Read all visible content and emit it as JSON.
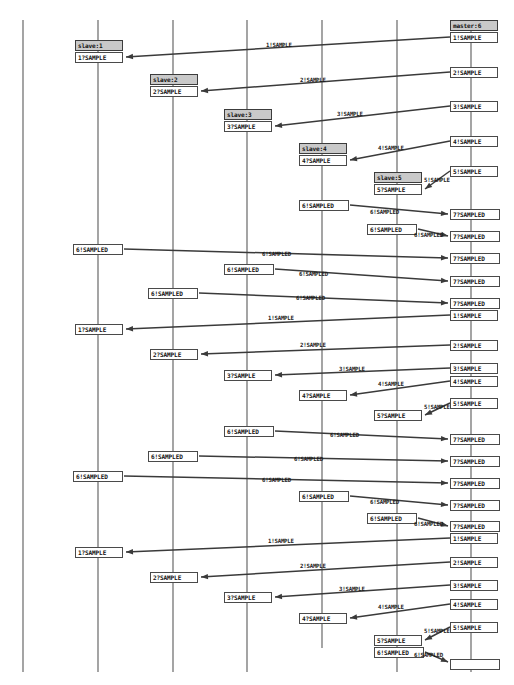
{
  "diagram": {
    "type": "uml-sequence-diagram",
    "title": "",
    "width": 514,
    "height": 685,
    "background_color": "#ffffff",
    "line_color": "#3a3a3a",
    "lifeline_color": "#5a5a5a",
    "head_fill_color": "#c9c9c9",
    "box_fill_color": "#ffffff",
    "lifelines": [
      {
        "name": "lifeline-0",
        "x": 23,
        "y1": 20,
        "y2": 672,
        "label": ""
      },
      {
        "name": "lifeline-1",
        "x": 98,
        "y1": 20,
        "y2": 672,
        "label": ""
      },
      {
        "name": "lifeline-2",
        "x": 173,
        "y1": 20,
        "y2": 672,
        "label": ""
      },
      {
        "name": "lifeline-3",
        "x": 247,
        "y1": 20,
        "y2": 672,
        "label": ""
      },
      {
        "name": "lifeline-4",
        "x": 322,
        "y1": 20,
        "y2": 648,
        "label": ""
      },
      {
        "name": "lifeline-5",
        "x": 397,
        "y1": 20,
        "y2": 672,
        "label": ""
      },
      {
        "name": "lifeline-6",
        "x": 471,
        "y1": 20,
        "y2": 672,
        "label": ""
      }
    ],
    "participants": [
      {
        "id": "master",
        "label": "master:6",
        "x": 450,
        "y": 20,
        "w": 48
      },
      {
        "id": "slave1",
        "label": "slave:1",
        "x": 75,
        "y": 40,
        "w": 48
      },
      {
        "id": "slave2",
        "label": "slave:2",
        "x": 150,
        "y": 74,
        "w": 48
      },
      {
        "id": "slave3",
        "label": "slave:3",
        "x": 224,
        "y": 109,
        "w": 48
      },
      {
        "id": "slave4",
        "label": "slave:4",
        "x": 299,
        "y": 143,
        "w": 48
      },
      {
        "id": "slave5",
        "label": "slave:5",
        "x": 374,
        "y": 172,
        "w": 48
      }
    ],
    "event_boxes": [
      {
        "text": "1!SAMPLE",
        "x": 450,
        "y": 32,
        "w": 48
      },
      {
        "text": "1?SAMPLE",
        "x": 75,
        "y": 52,
        "w": 48
      },
      {
        "text": "2!SAMPLE",
        "x": 450,
        "y": 67,
        "w": 48
      },
      {
        "text": "2?SAMPLE",
        "x": 150,
        "y": 86,
        "w": 48
      },
      {
        "text": "3!SAMPLE",
        "x": 450,
        "y": 101,
        "w": 48
      },
      {
        "text": "3?SAMPLE",
        "x": 224,
        "y": 121,
        "w": 48
      },
      {
        "text": "4!SAMPLE",
        "x": 450,
        "y": 136,
        "w": 48
      },
      {
        "text": "4?SAMPLE",
        "x": 299,
        "y": 155,
        "w": 48
      },
      {
        "text": "5!SAMPLE",
        "x": 450,
        "y": 166,
        "w": 48
      },
      {
        "text": "5?SAMPLE",
        "x": 374,
        "y": 184,
        "w": 48
      },
      {
        "text": "6!SAMPLED",
        "x": 299,
        "y": 200,
        "w": 50
      },
      {
        "text": "7?SAMPLED",
        "x": 450,
        "y": 209,
        "w": 50
      },
      {
        "text": "6!SAMPLED",
        "x": 367,
        "y": 224,
        "w": 50
      },
      {
        "text": "7?SAMPLED",
        "x": 450,
        "y": 231,
        "w": 50
      },
      {
        "text": "6!SAMPLED",
        "x": 73,
        "y": 244,
        "w": 50
      },
      {
        "text": "7?SAMPLED",
        "x": 450,
        "y": 253,
        "w": 50
      },
      {
        "text": "6!SAMPLED",
        "x": 224,
        "y": 264,
        "w": 50
      },
      {
        "text": "7?SAMPLED",
        "x": 450,
        "y": 276,
        "w": 50
      },
      {
        "text": "6!SAMPLED",
        "x": 148,
        "y": 288,
        "w": 50
      },
      {
        "text": "7?SAMPLED",
        "x": 450,
        "y": 298,
        "w": 50
      },
      {
        "text": "1!SAMPLE",
        "x": 450,
        "y": 310,
        "w": 48
      },
      {
        "text": "1?SAMPLE",
        "x": 75,
        "y": 324,
        "w": 48
      },
      {
        "text": "2!SAMPLE",
        "x": 450,
        "y": 340,
        "w": 48
      },
      {
        "text": "2?SAMPLE",
        "x": 150,
        "y": 349,
        "w": 48
      },
      {
        "text": "3!SAMPLE",
        "x": 450,
        "y": 363,
        "w": 48
      },
      {
        "text": "3?SAMPLE",
        "x": 224,
        "y": 370,
        "w": 48
      },
      {
        "text": "4!SAMPLE",
        "x": 450,
        "y": 376,
        "w": 48
      },
      {
        "text": "4?SAMPLE",
        "x": 299,
        "y": 390,
        "w": 48
      },
      {
        "text": "5!SAMPLE",
        "x": 450,
        "y": 398,
        "w": 48
      },
      {
        "text": "5?SAMPLE",
        "x": 374,
        "y": 410,
        "w": 48
      },
      {
        "text": "6!SAMPLED",
        "x": 224,
        "y": 426,
        "w": 50
      },
      {
        "text": "7?SAMPLED",
        "x": 450,
        "y": 434,
        "w": 50
      },
      {
        "text": "6!SAMPLED",
        "x": 148,
        "y": 451,
        "w": 50
      },
      {
        "text": "7?SAMPLED",
        "x": 450,
        "y": 456,
        "w": 50
      },
      {
        "text": "6!SAMPLED",
        "x": 73,
        "y": 471,
        "w": 50
      },
      {
        "text": "7?SAMPLED",
        "x": 450,
        "y": 478,
        "w": 50
      },
      {
        "text": "6!SAMPLED",
        "x": 299,
        "y": 491,
        "w": 50
      },
      {
        "text": "7?SAMPLED",
        "x": 450,
        "y": 500,
        "w": 50
      },
      {
        "text": "6!SAMPLED",
        "x": 367,
        "y": 513,
        "w": 50
      },
      {
        "text": "7?SAMPLED",
        "x": 450,
        "y": 521,
        "w": 50
      },
      {
        "text": "1!SAMPLE",
        "x": 450,
        "y": 533,
        "w": 48
      },
      {
        "text": "1?SAMPLE",
        "x": 75,
        "y": 547,
        "w": 48
      },
      {
        "text": "2!SAMPLE",
        "x": 450,
        "y": 557,
        "w": 48
      },
      {
        "text": "2?SAMPLE",
        "x": 150,
        "y": 572,
        "w": 48
      },
      {
        "text": "3!SAMPLE",
        "x": 450,
        "y": 580,
        "w": 48
      },
      {
        "text": "3?SAMPLE",
        "x": 224,
        "y": 592,
        "w": 48
      },
      {
        "text": "4!SAMPLE",
        "x": 450,
        "y": 599,
        "w": 48
      },
      {
        "text": "4?SAMPLE",
        "x": 299,
        "y": 613,
        "w": 48
      },
      {
        "text": "5!SAMPLE",
        "x": 450,
        "y": 622,
        "w": 48
      },
      {
        "text": "5?SAMPLE",
        "x": 374,
        "y": 635,
        "w": 48
      },
      {
        "text": "6!SAMPLED",
        "x": 374,
        "y": 647,
        "w": 50
      },
      {
        "text": "",
        "x": 450,
        "y": 659,
        "w": 50
      }
    ],
    "messages": [
      {
        "label": "1!SAMPLE",
        "x1": 450,
        "y1": 37,
        "x2": 126,
        "y2": 57,
        "lx": 266,
        "ly": 42
      },
      {
        "label": "2!SAMPLE",
        "x1": 450,
        "y1": 72,
        "x2": 201,
        "y2": 91,
        "lx": 300,
        "ly": 77
      },
      {
        "label": "3!SAMPLE",
        "x1": 450,
        "y1": 106,
        "x2": 275,
        "y2": 126,
        "lx": 337,
        "ly": 111
      },
      {
        "label": "4!SAMPLE",
        "x1": 450,
        "y1": 141,
        "x2": 350,
        "y2": 160,
        "lx": 378,
        "ly": 145
      },
      {
        "label": "5!SAMPLE",
        "x1": 450,
        "y1": 171,
        "x2": 425,
        "y2": 189,
        "lx": 424,
        "ly": 177
      },
      {
        "label": "6!SAMPLED",
        "x1": 350,
        "y1": 205,
        "x2": 448,
        "y2": 214,
        "lx": 370,
        "ly": 209
      },
      {
        "label": "6!SAMPLED",
        "x1": 418,
        "y1": 229,
        "x2": 448,
        "y2": 236,
        "lx": 414,
        "ly": 232
      },
      {
        "label": "6!SAMPLED",
        "x1": 124,
        "y1": 249,
        "x2": 448,
        "y2": 258,
        "lx": 262,
        "ly": 251
      },
      {
        "label": "6!SAMPLED",
        "x1": 275,
        "y1": 269,
        "x2": 448,
        "y2": 281,
        "lx": 299,
        "ly": 271
      },
      {
        "label": "6!SAMPLED",
        "x1": 199,
        "y1": 293,
        "x2": 448,
        "y2": 303,
        "lx": 296,
        "ly": 295
      },
      {
        "label": "1!SAMPLE",
        "x1": 450,
        "y1": 315,
        "x2": 126,
        "y2": 329,
        "lx": 268,
        "ly": 315
      },
      {
        "label": "2!SAMPLE",
        "x1": 450,
        "y1": 345,
        "x2": 201,
        "y2": 354,
        "lx": 300,
        "ly": 342
      },
      {
        "label": "3!SAMPLE",
        "x1": 450,
        "y1": 368,
        "x2": 275,
        "y2": 375,
        "lx": 339,
        "ly": 366
      },
      {
        "label": "4!SAMPLE",
        "x1": 450,
        "y1": 381,
        "x2": 350,
        "y2": 395,
        "lx": 378,
        "ly": 381
      },
      {
        "label": "5!SAMPLE",
        "x1": 450,
        "y1": 403,
        "x2": 425,
        "y2": 415,
        "lx": 424,
        "ly": 404
      },
      {
        "label": "6!SAMPLED",
        "x1": 275,
        "y1": 431,
        "x2": 448,
        "y2": 439,
        "lx": 330,
        "ly": 432
      },
      {
        "label": "6!SAMPLED",
        "x1": 199,
        "y1": 456,
        "x2": 448,
        "y2": 461,
        "lx": 294,
        "ly": 456
      },
      {
        "label": "6!SAMPLED",
        "x1": 124,
        "y1": 476,
        "x2": 448,
        "y2": 483,
        "lx": 262,
        "ly": 477
      },
      {
        "label": "6!SAMPLED",
        "x1": 350,
        "y1": 496,
        "x2": 448,
        "y2": 505,
        "lx": 370,
        "ly": 499
      },
      {
        "label": "6!SAMPLED",
        "x1": 418,
        "y1": 518,
        "x2": 448,
        "y2": 526,
        "lx": 414,
        "ly": 521
      },
      {
        "label": "1!SAMPLE",
        "x1": 450,
        "y1": 538,
        "x2": 126,
        "y2": 552,
        "lx": 268,
        "ly": 538
      },
      {
        "label": "2!SAMPLE",
        "x1": 450,
        "y1": 562,
        "x2": 201,
        "y2": 577,
        "lx": 300,
        "ly": 563
      },
      {
        "label": "3!SAMPLE",
        "x1": 450,
        "y1": 585,
        "x2": 275,
        "y2": 597,
        "lx": 339,
        "ly": 586
      },
      {
        "label": "4!SAMPLE",
        "x1": 450,
        "y1": 604,
        "x2": 350,
        "y2": 618,
        "lx": 378,
        "ly": 604
      },
      {
        "label": "5!SAMPLE",
        "x1": 450,
        "y1": 627,
        "x2": 425,
        "y2": 640,
        "lx": 424,
        "ly": 628
      },
      {
        "label": "6!SAMPLED",
        "x1": 425,
        "y1": 652,
        "x2": 448,
        "y2": 662,
        "lx": 414,
        "ly": 652
      }
    ]
  }
}
